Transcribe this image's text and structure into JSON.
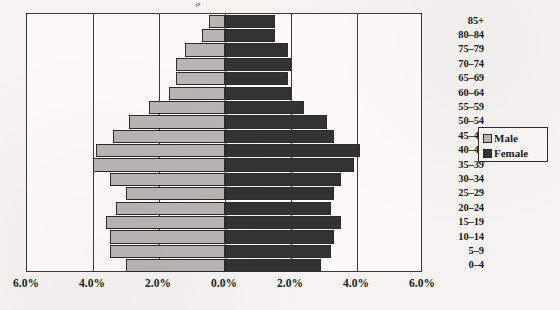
{
  "chart_data": {
    "type": "bar",
    "subtype": "population-pyramid",
    "title": "",
    "xlabel": "",
    "ylabel": "",
    "orientation": "horizontal",
    "grid": true,
    "legend_position": "right",
    "categories": [
      "0–4",
      "5–9",
      "10–14",
      "15–19",
      "20–24",
      "25–29",
      "30–34",
      "35–39",
      "40–44",
      "45–49",
      "50–54",
      "55–59",
      "60–64",
      "65–69",
      "70–74",
      "75–79",
      "80–84",
      "85+"
    ],
    "series": [
      {
        "name": "Male",
        "color": "#b6b5b2",
        "side": "left",
        "values": [
          3.0,
          3.5,
          3.5,
          3.6,
          3.3,
          3.0,
          3.5,
          4.0,
          3.9,
          3.4,
          2.9,
          2.3,
          1.7,
          1.5,
          1.5,
          1.2,
          0.7,
          0.5
        ]
      },
      {
        "name": "Female",
        "color": "#333333",
        "side": "right",
        "values": [
          2.9,
          3.2,
          3.3,
          3.5,
          3.2,
          3.3,
          3.5,
          3.9,
          4.1,
          3.3,
          3.1,
          2.4,
          2.0,
          1.9,
          2.0,
          1.9,
          1.5,
          1.5
        ]
      }
    ],
    "xlim": [
      -6.0,
      6.0
    ],
    "x_ticks": [
      -6.0,
      -4.0,
      -2.0,
      0.0,
      2.0,
      4.0,
      6.0
    ],
    "x_tick_labels": [
      "6.0%",
      "4.0%",
      "2.0%",
      "0.0%",
      "2.0%",
      "4.0%",
      "6.0%"
    ],
    "units": "percent"
  },
  "legend": {
    "items": [
      {
        "label": "Male",
        "swatch": "male"
      },
      {
        "label": "Female",
        "swatch": "female"
      }
    ]
  },
  "title_fragment": "g"
}
